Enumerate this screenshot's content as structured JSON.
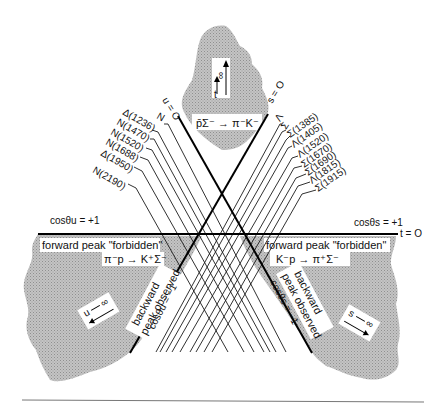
{
  "regions": {
    "top": {
      "reaction": "p̄Σ⁻ → π⁻K⁻",
      "limit_label": "t → ∞",
      "limit_var": "t",
      "limit_symbol": "∞"
    },
    "left": {
      "reaction": "π⁻p → K⁺Σ⁻",
      "forward_label": "forward peak \"forbidden\"",
      "backward_label_1": "backward",
      "backward_label_2": "peak observed",
      "limit_var": "u",
      "limit_symbol": "∞"
    },
    "right": {
      "reaction": "K⁻p → π⁺Σ⁻",
      "forward_label": "forward peak \"forbidden\"",
      "backward_label_1": "backward",
      "backward_label_2": "peak observed",
      "limit_var": "s",
      "limit_symbol": "∞"
    }
  },
  "lines": {
    "t_zero": "t = O",
    "u_zero": "u = O",
    "s_zero": "s = O",
    "cos_u_plus": "cosθu = +1",
    "cos_s_plus": "cosθs = +1",
    "cos_u_minus": "cosθu = −1",
    "cos_s_minus": "cosθs = −1"
  },
  "u_channel_resonances": [
    "N",
    "Δ(1236)",
    "N(1470)",
    "N(1520)",
    "N(1688)",
    "Δ(1950)",
    "N(2190)"
  ],
  "s_channel_resonances": [
    "Λ",
    "Σ",
    "Σ(1385)",
    "Λ(1405)",
    "Λ(1520)",
    "Σ(1670)",
    "Σ(1690)",
    "Λ(1815)",
    "Λ(1815)b",
    "Σ(1915)"
  ],
  "s_channel_display": [
    "Λ",
    "Σ",
    "Σ(1385)",
    "Λ(1405)",
    "Λ(1520)",
    "Σ(1670)",
    "Σ(1690)",
    "Λ(1815)",
    "Σ(1915)"
  ],
  "colors": {
    "shade": "#b3b3b3",
    "line": "#1a1a1a",
    "bg": "#ffffff"
  }
}
